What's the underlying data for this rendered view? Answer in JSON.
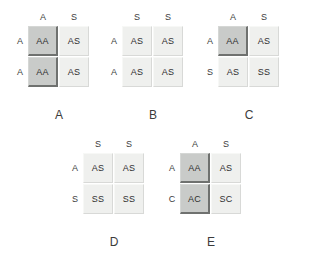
{
  "figure": {
    "background_color": "#ffffff",
    "shaded_cell_color": "#c9cbc9",
    "light_cell_color": "#eff0ee"
  },
  "squares": [
    {
      "id": "a",
      "caption": "A",
      "x": 28,
      "y": 26,
      "caption_y": 108,
      "col_headers": [
        "A",
        "S"
      ],
      "row_headers": [
        "A",
        "A"
      ],
      "cells": [
        {
          "text": "AA",
          "shaded": true
        },
        {
          "text": "AS",
          "shaded": false
        },
        {
          "text": "AA",
          "shaded": true
        },
        {
          "text": "AS",
          "shaded": false
        }
      ]
    },
    {
      "id": "b",
      "caption": "B",
      "x": 122,
      "y": 26,
      "caption_y": 108,
      "col_headers": [
        "S",
        "S"
      ],
      "row_headers": [
        "A",
        "A"
      ],
      "cells": [
        {
          "text": "AS",
          "shaded": false
        },
        {
          "text": "AS",
          "shaded": false
        },
        {
          "text": "AS",
          "shaded": false
        },
        {
          "text": "AS",
          "shaded": false
        }
      ]
    },
    {
      "id": "c",
      "caption": "C",
      "x": 218,
      "y": 26,
      "caption_y": 108,
      "col_headers": [
        "A",
        "S"
      ],
      "row_headers": [
        "A",
        "S"
      ],
      "cells": [
        {
          "text": "AA",
          "shaded": true
        },
        {
          "text": "AS",
          "shaded": false
        },
        {
          "text": "AS",
          "shaded": false
        },
        {
          "text": "SS",
          "shaded": false
        }
      ]
    },
    {
      "id": "d",
      "caption": "D",
      "x": 83,
      "y": 153,
      "caption_y": 235,
      "col_headers": [
        "S",
        "S"
      ],
      "row_headers": [
        "A",
        "S"
      ],
      "cells": [
        {
          "text": "AS",
          "shaded": false
        },
        {
          "text": "AS",
          "shaded": false
        },
        {
          "text": "SS",
          "shaded": false
        },
        {
          "text": "SS",
          "shaded": false
        }
      ]
    },
    {
      "id": "e",
      "caption": "E",
      "x": 180,
      "y": 153,
      "caption_y": 235,
      "col_headers": [
        "A",
        "S"
      ],
      "row_headers": [
        "A",
        "C"
      ],
      "cells": [
        {
          "text": "AA",
          "shaded": true
        },
        {
          "text": "AS",
          "shaded": false
        },
        {
          "text": "AC",
          "shaded": true
        },
        {
          "text": "SC",
          "shaded": false
        }
      ]
    }
  ]
}
